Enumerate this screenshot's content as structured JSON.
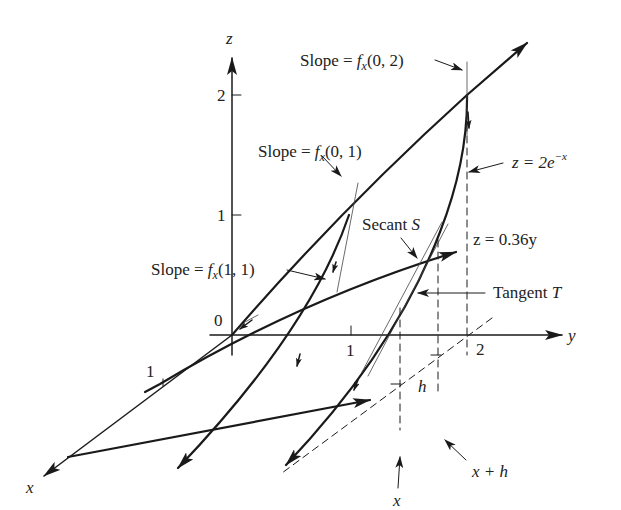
{
  "figure": {
    "type": "3d-surface-cross-section-diagram",
    "axes": {
      "z": {
        "label": "z",
        "ticks": [
          "0",
          "1",
          "2"
        ]
      },
      "y": {
        "label": "y",
        "ticks": [
          "1",
          "2"
        ]
      },
      "x": {
        "label": "x",
        "ticks": [
          "1"
        ]
      }
    },
    "annotations": {
      "slope_02": {
        "prefix": "Slope = ",
        "func": "f",
        "sub": "x",
        "args": "(0, 2)"
      },
      "slope_01": {
        "prefix": "Slope = ",
        "func": "f",
        "sub": "x",
        "args": "(0, 1)"
      },
      "slope_11": {
        "prefix": "Slope = ",
        "func": "f",
        "sub": "x",
        "args": "(1, 1)"
      },
      "curve_exp": {
        "lhs": "z = 2e",
        "sup": "−x"
      },
      "plane_line": {
        "text": "z = 0.36y"
      },
      "secant": {
        "word": "Secant ",
        "var": "S"
      },
      "tangent": {
        "word": "Tangent ",
        "var": "T"
      },
      "x_mark": {
        "text": "x"
      },
      "x_plus_h": {
        "text": "x + h"
      },
      "h_mark": {
        "text": "h"
      }
    },
    "colors": {
      "ink": "#1a1a1a",
      "background": "#ffffff"
    }
  }
}
